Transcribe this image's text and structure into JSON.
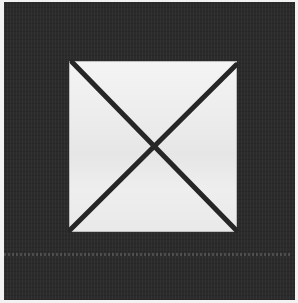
{
  "image": {
    "description": "Dark textured fabric with a light square patch crossed by a dark X",
    "colors": {
      "background_border": "#f2f2f2",
      "fabric": "#2b2b2b",
      "square": "#ececec",
      "cross": "#262626"
    }
  }
}
